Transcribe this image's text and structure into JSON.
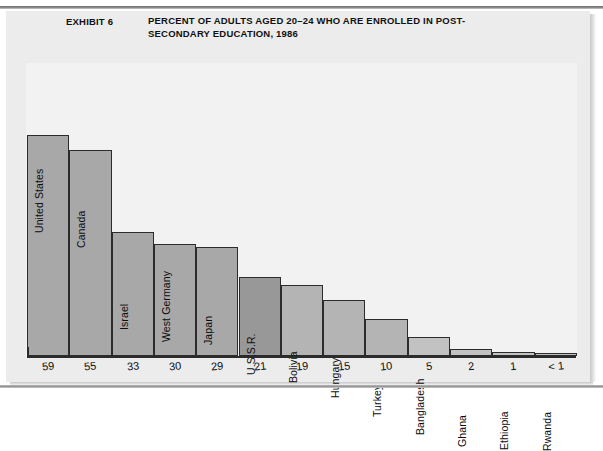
{
  "exhibit": {
    "label": "EXHIBIT 6",
    "title_line1": "PERCENT OF ADULTS AGED 20–24 WHO ARE ENROLLED IN POST-",
    "title_line2": "SECONDARY EDUCATION, 1986"
  },
  "legend": {
    "items": [
      {
        "label": "High-income countries",
        "color": "#a8a8a8"
      },
      {
        "label": "Middle-income countries",
        "color": "#b4b4b4"
      },
      {
        "label": "Low-income countries",
        "color": "#c2c2c2"
      },
      {
        "label": "U.S.S.R.",
        "color": "#989898"
      }
    ]
  },
  "chart_data": {
    "type": "bar",
    "xlabel": "",
    "ylabel": "",
    "ylim": [
      0,
      62
    ],
    "grid": false,
    "legend_position": "top-right",
    "categories": [
      "United States",
      "Canada",
      "Israel",
      "West Germany",
      "Japan",
      "U.S.S.R.",
      "Bolivia",
      "Hungary",
      "Turkey",
      "Bangladesh",
      "Ghana",
      "Ethiopia",
      "Rwanda"
    ],
    "values": [
      59,
      55,
      33,
      30,
      29,
      21,
      19,
      15,
      10,
      5,
      2,
      1,
      0.5
    ],
    "value_labels": [
      "59",
      "55",
      "33",
      "30",
      "29",
      "21",
      "19",
      "15",
      "10",
      "5",
      "2",
      "1",
      "< 1"
    ],
    "groups": [
      "High-income countries",
      "High-income countries",
      "High-income countries",
      "High-income countries",
      "High-income countries",
      "U.S.S.R.",
      "Middle-income countries",
      "Middle-income countries",
      "Middle-income countries",
      "Low-income countries",
      "Low-income countries",
      "Low-income countries",
      "Low-income countries"
    ],
    "colors": [
      "#a8a8a8",
      "#a8a8a8",
      "#a8a8a8",
      "#a8a8a8",
      "#a8a8a8",
      "#989898",
      "#b4b4b4",
      "#b4b4b4",
      "#b4b4b4",
      "#c2c2c2",
      "#c2c2c2",
      "#c2c2c2",
      "#c2c2c2"
    ]
  }
}
